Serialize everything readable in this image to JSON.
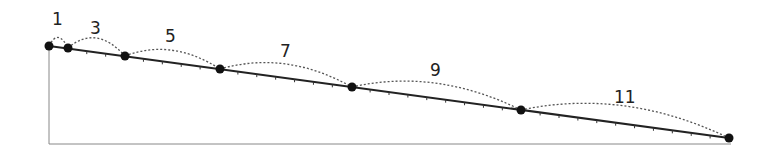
{
  "diagram": {
    "labels": [
      "1",
      "3",
      "5",
      "7",
      "9",
      "11"
    ],
    "colors": {
      "line": "#222222",
      "dot": "#111111",
      "arc": "#555555",
      "frame": "#888888"
    }
  }
}
